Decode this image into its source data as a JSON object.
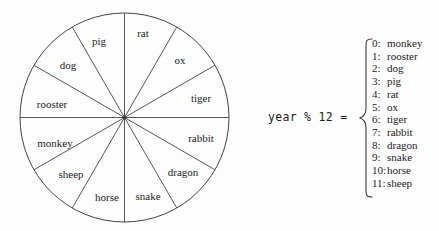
{
  "figure": {
    "background_color": "#fdfdfd",
    "stroke_color": "#444444"
  },
  "wheel": {
    "center_x": 124.5,
    "center_y": 117.5,
    "radius": 104.5,
    "sector_count": 12,
    "sectors": [
      {
        "index": 0,
        "label": "rat",
        "label_x": 143,
        "label_y": 33,
        "start_deg": -90,
        "end_deg": -60
      },
      {
        "index": 1,
        "label": "ox",
        "label_x": 180,
        "label_y": 60,
        "start_deg": -60,
        "end_deg": -30
      },
      {
        "index": 2,
        "label": "tiger",
        "label_x": 201,
        "label_y": 98,
        "start_deg": -30,
        "end_deg": 0
      },
      {
        "index": 3,
        "label": "rabbit",
        "label_x": 201,
        "label_y": 138,
        "start_deg": 0,
        "end_deg": 30
      },
      {
        "index": 4,
        "label": "dragon",
        "label_x": 183,
        "label_y": 172,
        "start_deg": 30,
        "end_deg": 60
      },
      {
        "index": 5,
        "label": "snake",
        "label_x": 148,
        "label_y": 196,
        "start_deg": 60,
        "end_deg": 90
      },
      {
        "index": 6,
        "label": "horse",
        "label_x": 107,
        "label_y": 197,
        "start_deg": 90,
        "end_deg": 120
      },
      {
        "index": 7,
        "label": "sheep",
        "label_x": 71,
        "label_y": 174,
        "start_deg": 120,
        "end_deg": 150
      },
      {
        "index": 8,
        "label": "monkey",
        "label_x": 55,
        "label_y": 143,
        "start_deg": 150,
        "end_deg": 180
      },
      {
        "index": 9,
        "label": "rooster",
        "label_x": 52,
        "label_y": 104,
        "start_deg": 180,
        "end_deg": 210
      },
      {
        "index": 10,
        "label": "dog",
        "label_x": 68,
        "label_y": 65,
        "start_deg": 210,
        "end_deg": 240
      },
      {
        "index": 11,
        "label": "pig",
        "label_x": 99,
        "label_y": 41,
        "start_deg": 240,
        "end_deg": 270
      }
    ]
  },
  "formula": {
    "text": "year % 12 ="
  },
  "legend": {
    "brace": "{",
    "items": [
      {
        "key": "0:",
        "value": "monkey"
      },
      {
        "key": "1:",
        "value": "rooster"
      },
      {
        "key": "2:",
        "value": "dog"
      },
      {
        "key": "3:",
        "value": "pig"
      },
      {
        "key": "4:",
        "value": "rat"
      },
      {
        "key": "5:",
        "value": "ox"
      },
      {
        "key": "6:",
        "value": "tiger"
      },
      {
        "key": "7:",
        "value": "rabbit"
      },
      {
        "key": "8:",
        "value": "dragon"
      },
      {
        "key": "9:",
        "value": "snake"
      },
      {
        "key": "10:",
        "value": "horse"
      },
      {
        "key": "11:",
        "value": "sheep"
      }
    ]
  }
}
